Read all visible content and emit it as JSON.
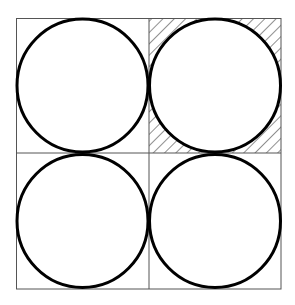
{
  "diagram": {
    "grid": {
      "rows": 2,
      "cols": 2
    },
    "cells": [
      {
        "position": "top-left",
        "circle": true,
        "hatched": false
      },
      {
        "position": "top-right",
        "circle": true,
        "hatched": true
      },
      {
        "position": "bottom-left",
        "circle": true,
        "hatched": false
      },
      {
        "position": "bottom-right",
        "circle": true,
        "hatched": false
      }
    ],
    "colors": {
      "line": "#555555",
      "circle": "#000000",
      "hatch": "#222222",
      "background": "#ffffff"
    }
  }
}
